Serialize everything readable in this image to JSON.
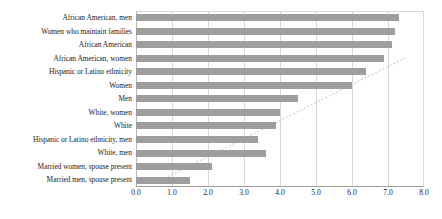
{
  "chart_data": {
    "type": "bar",
    "orientation": "horizontal",
    "title": "",
    "xlabel": "",
    "ylabel": "",
    "xlim": [
      0.0,
      8.0
    ],
    "xticks": [
      "0.0",
      "1.0",
      "2.0",
      "3.0",
      "4.0",
      "5.0",
      "6.0",
      "7.0",
      "8.0"
    ],
    "grid": true,
    "legend": "none",
    "bar_color": "#9e9e9e",
    "categories": [
      "African American, men",
      "Women who maintain families",
      "African American",
      "African American, women",
      "Hispanic or Latino ethnicity",
      "Women",
      "Men",
      "White, women",
      "White",
      "Hispanic or Latino ethnicity, men",
      "White, men",
      "Married women, spouse present",
      "Married men, spouse present"
    ],
    "values": [
      7.3,
      7.2,
      7.1,
      6.9,
      6.4,
      6.0,
      4.5,
      4.0,
      3.9,
      3.4,
      3.6,
      2.1,
      1.5
    ]
  }
}
